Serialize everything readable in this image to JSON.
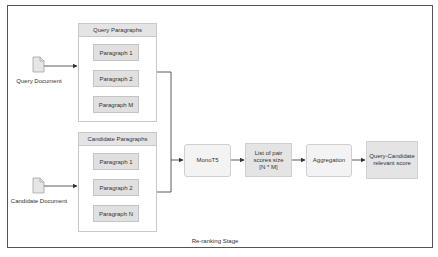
{
  "diagram": {
    "stage_label": "Re-ranking Stage",
    "inputs": {
      "query_document": {
        "label": "Query Document",
        "icon": "document-icon"
      },
      "candidate_document": {
        "label": "Candidate Document",
        "icon": "document-icon"
      }
    },
    "groups": {
      "query": {
        "title": "Query Paragraphs",
        "items": [
          "Paragraph  1",
          "Paragraph  2",
          "Paragraph  M"
        ]
      },
      "candidate": {
        "title": "Candidate Paragraphs",
        "items": [
          "Paragraph  1",
          "Paragraph  2",
          "Paragraph  N"
        ]
      }
    },
    "pipeline": {
      "model": "MonoT5",
      "scores": "List of pair scores size [N * M]",
      "scores_lines": [
        "List of pair",
        "scores size",
        "[N * M]"
      ],
      "aggregation": "Aggregation",
      "output_lines": [
        "Query-Candidate",
        "relevant score"
      ]
    },
    "colors": {
      "frame_border": "#555555",
      "header_fill": "#e4e4e4",
      "paragraph_fill": "#e0e0e0",
      "node_fill": "#f3f3f3",
      "arrow": "#333333"
    }
  }
}
